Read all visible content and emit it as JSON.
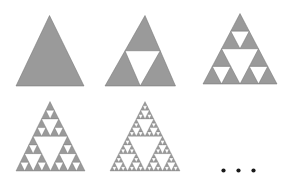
{
  "figure": {
    "background_color": "#ffffff",
    "width": 290,
    "height": 186,
    "fill_color": "#9a9a9a",
    "stroke_color": "#6f6f6f",
    "stroke_width": 0.5,
    "dot_color": "#1a1a1a"
  },
  "panels": [
    {
      "name": "iteration-0",
      "label": "Stage 0",
      "depth": 0,
      "shaded_triangles": 1,
      "apex": {
        "x": 49.5,
        "y": 15.5
      },
      "left": {
        "x": 16.0,
        "y": 86.0
      },
      "right": {
        "x": 84.0,
        "y": 86.0
      }
    },
    {
      "name": "iteration-1",
      "label": "Stage 1",
      "depth": 1,
      "shaded_triangles": 3,
      "apex": {
        "x": 145.0,
        "y": 15.5
      },
      "left": {
        "x": 105.0,
        "y": 86.0
      },
      "right": {
        "x": 175.5,
        "y": 86.0
      }
    },
    {
      "name": "iteration-2",
      "label": "Stage 2",
      "depth": 2,
      "shaded_triangles": 9,
      "apex": {
        "x": 240.0,
        "y": 13.5
      },
      "left": {
        "x": 203.0,
        "y": 84.0
      },
      "right": {
        "x": 277.0,
        "y": 84.0
      }
    },
    {
      "name": "iteration-3",
      "label": "Stage 3",
      "depth": 3,
      "shaded_triangles": 27,
      "apex": {
        "x": 50.0,
        "y": 101.5
      },
      "left": {
        "x": 16.0,
        "y": 171.0
      },
      "right": {
        "x": 85.0,
        "y": 171.0
      }
    },
    {
      "name": "iteration-4",
      "label": "Stage 4",
      "depth": 4,
      "shaded_triangles": 81,
      "apex": {
        "x": 145.0,
        "y": 101.5
      },
      "left": {
        "x": 110.0,
        "y": 171.0
      },
      "right": {
        "x": 180.0,
        "y": 171.0
      }
    }
  ],
  "ellipsis": {
    "name": "continuation-ellipsis",
    "text": "...",
    "dots": [
      {
        "cx": 223.5,
        "cy": 170.5,
        "r": 2.1
      },
      {
        "cx": 238.5,
        "cy": 170.5,
        "r": 2.1
      },
      {
        "cx": 253.5,
        "cy": 170.5,
        "r": 2.1
      }
    ]
  }
}
